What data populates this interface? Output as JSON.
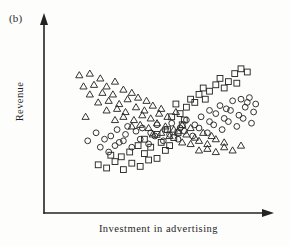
{
  "figure": {
    "panel_label": "(b)",
    "x_axis_label": "Investment in advertising",
    "y_axis_label": "Revenue",
    "marker_color": "#2a2a2a",
    "axis_color": "#232323",
    "background_color": "#fdfdfc"
  },
  "chart_data": {
    "type": "scatter",
    "title": "(b)",
    "xlabel": "Investment in advertising",
    "ylabel": "Revenue",
    "xlim": [
      0,
      100
    ],
    "ylim": [
      0,
      100
    ],
    "grid": false,
    "axis_ticks": false,
    "axis_style": "arrow-terminated open axes, no tick marks or numeric scale",
    "legend": null,
    "legend_position": "none",
    "annotations": [],
    "series": [
      {
        "name": "triangles",
        "marker": "triangle-open",
        "trend": "decreasing",
        "points": [
          [
            13,
            78
          ],
          [
            18,
            79
          ],
          [
            23,
            76
          ],
          [
            15,
            71
          ],
          [
            20,
            72
          ],
          [
            26,
            71
          ],
          [
            30,
            74
          ],
          [
            18,
            66
          ],
          [
            24,
            67
          ],
          [
            29,
            66
          ],
          [
            34,
            69
          ],
          [
            38,
            67
          ],
          [
            22,
            61
          ],
          [
            27,
            62
          ],
          [
            32,
            60
          ],
          [
            36,
            63
          ],
          [
            41,
            64
          ],
          [
            45,
            62
          ],
          [
            26,
            56
          ],
          [
            31,
            57
          ],
          [
            35,
            55
          ],
          [
            40,
            58
          ],
          [
            44,
            56
          ],
          [
            48,
            59
          ],
          [
            52,
            57
          ],
          [
            16,
            52
          ],
          [
            30,
            50
          ],
          [
            34,
            52
          ],
          [
            39,
            50
          ],
          [
            43,
            53
          ],
          [
            47,
            51
          ],
          [
            51,
            54
          ],
          [
            55,
            52
          ],
          [
            59,
            55
          ],
          [
            38,
            46
          ],
          [
            42,
            47
          ],
          [
            46,
            45
          ],
          [
            50,
            48
          ],
          [
            54,
            46
          ],
          [
            58,
            44
          ],
          [
            62,
            47
          ],
          [
            66,
            45
          ],
          [
            48,
            41
          ],
          [
            52,
            42
          ],
          [
            56,
            40
          ],
          [
            60,
            43
          ],
          [
            64,
            41
          ],
          [
            68,
            39
          ],
          [
            72,
            42
          ],
          [
            76,
            40
          ],
          [
            62,
            36
          ],
          [
            66,
            35
          ],
          [
            70,
            37
          ],
          [
            74,
            35
          ],
          [
            78,
            38
          ],
          [
            82,
            36
          ],
          [
            70,
            31
          ],
          [
            74,
            32
          ],
          [
            78,
            30
          ],
          [
            82,
            33
          ],
          [
            86,
            31
          ],
          [
            90,
            34
          ]
        ]
      },
      {
        "name": "circles",
        "marker": "circle-open",
        "trend": "increasing",
        "points": [
          [
            17,
            37
          ],
          [
            21,
            42
          ],
          [
            25,
            38
          ],
          [
            23,
            33
          ],
          [
            28,
            40
          ],
          [
            32,
            36
          ],
          [
            27,
            30
          ],
          [
            31,
            44
          ],
          [
            35,
            41
          ],
          [
            30,
            34
          ],
          [
            36,
            46
          ],
          [
            40,
            43
          ],
          [
            34,
            37
          ],
          [
            38,
            33
          ],
          [
            43,
            45
          ],
          [
            47,
            42
          ],
          [
            42,
            38
          ],
          [
            46,
            35
          ],
          [
            50,
            47
          ],
          [
            54,
            44
          ],
          [
            49,
            40
          ],
          [
            53,
            37
          ],
          [
            57,
            48
          ],
          [
            61,
            45
          ],
          [
            56,
            41
          ],
          [
            60,
            38
          ],
          [
            64,
            50
          ],
          [
            68,
            47
          ],
          [
            63,
            43
          ],
          [
            67,
            40
          ],
          [
            71,
            52
          ],
          [
            75,
            49
          ],
          [
            70,
            45
          ],
          [
            74,
            42
          ],
          [
            78,
            54
          ],
          [
            82,
            51
          ],
          [
            77,
            47
          ],
          [
            81,
            44
          ],
          [
            85,
            56
          ],
          [
            89,
            53
          ],
          [
            84,
            49
          ],
          [
            88,
            46
          ],
          [
            92,
            58
          ],
          [
            96,
            55
          ],
          [
            91,
            51
          ],
          [
            95,
            48
          ],
          [
            93,
            61
          ],
          [
            97,
            60
          ],
          [
            86,
            62
          ],
          [
            90,
            63
          ],
          [
            94,
            64
          ],
          [
            80,
            59
          ],
          [
            83,
            57
          ],
          [
            75,
            56
          ]
        ]
      },
      {
        "name": "squares",
        "marker": "square-open",
        "trend": "u-shaped rising to the right",
        "points": [
          [
            22,
            22
          ],
          [
            26,
            20
          ],
          [
            30,
            24
          ],
          [
            34,
            19
          ],
          [
            38,
            23
          ],
          [
            42,
            21
          ],
          [
            46,
            25
          ],
          [
            28,
            28
          ],
          [
            33,
            27
          ],
          [
            37,
            30
          ],
          [
            44,
            29
          ],
          [
            50,
            26
          ],
          [
            54,
            31
          ],
          [
            41,
            34
          ],
          [
            47,
            33
          ],
          [
            52,
            36
          ],
          [
            56,
            34
          ],
          [
            58,
            39
          ],
          [
            60,
            42
          ],
          [
            62,
            47
          ],
          [
            57,
            52
          ],
          [
            61,
            54
          ],
          [
            64,
            58
          ],
          [
            59,
            60
          ],
          [
            66,
            63
          ],
          [
            70,
            66
          ],
          [
            68,
            61
          ],
          [
            72,
            70
          ],
          [
            75,
            68
          ],
          [
            78,
            72
          ],
          [
            73,
            63
          ],
          [
            80,
            76
          ],
          [
            84,
            74
          ],
          [
            87,
            79
          ],
          [
            82,
            70
          ],
          [
            90,
            82
          ],
          [
            93,
            80
          ],
          [
            88,
            73
          ],
          [
            63,
            50
          ],
          [
            55,
            44
          ],
          [
            50,
            41
          ],
          [
            44,
            38
          ]
        ]
      }
    ]
  }
}
